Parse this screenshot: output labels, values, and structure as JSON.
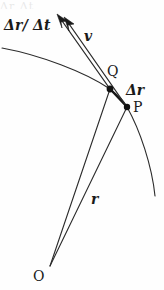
{
  "figure": {
    "background_color": "#fefefe",
    "ink_color": "#1a1a1a",
    "width": 164,
    "height": 290,
    "top_edge_artifact": "Δr Δt"
  },
  "labels": {
    "dr_over_dt": "Δr/ Δt",
    "velocity": "v",
    "point_q": "Q",
    "delta_r": "Δr",
    "point_p": "P",
    "position_r": "r",
    "origin_o": "O"
  },
  "geometry": {
    "origin_point": {
      "x": 50,
      "y": 266
    },
    "point_q": {
      "x": 110,
      "y": 89
    },
    "point_p": {
      "x": 127,
      "y": 107
    },
    "trajectory_arc": {
      "start": {
        "x": 2,
        "y": 48
      },
      "through_q": {
        "x": 110,
        "y": 89
      },
      "through_p": {
        "x": 127,
        "y": 107
      },
      "end": {
        "x": 155,
        "y": 196
      }
    },
    "vector_v_arrow": {
      "from": {
        "x": 110,
        "y": 89
      },
      "to": {
        "x": 57,
        "y": 14
      }
    },
    "vector_dr_dt_arrow": {
      "from": {
        "x": 127,
        "y": 107
      },
      "to": {
        "x": 64,
        "y": 17
      }
    },
    "vector_delta_r": {
      "from": {
        "x": 110,
        "y": 89
      },
      "to": {
        "x": 127,
        "y": 107
      }
    },
    "radius_to_q": {
      "from": {
        "x": 50,
        "y": 266
      },
      "to": {
        "x": 110,
        "y": 89
      }
    },
    "radius_to_p": {
      "from": {
        "x": 50,
        "y": 266
      },
      "to": {
        "x": 127,
        "y": 107
      }
    }
  }
}
